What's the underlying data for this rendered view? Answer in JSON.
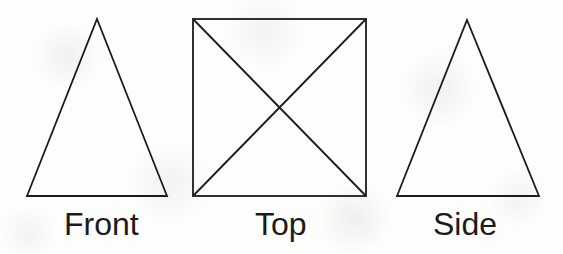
{
  "figure": {
    "width": 563,
    "height": 254,
    "background_color": "#fdfdfc",
    "line_color": "#1b1b1b",
    "line_width": 1.8,
    "label_color": "#1b1b1b",
    "label_font_size": 32
  },
  "views": [
    {
      "id": "front",
      "label": "Front",
      "shape": "triangle",
      "points": "97,19 167,196 27,196",
      "label_left": 64,
      "label_top": 208
    },
    {
      "id": "top",
      "label": "Top",
      "shape": "square-with-diagonals",
      "rect": {
        "x": 193,
        "y": 19,
        "width": 173,
        "height": 177
      },
      "diagonal_1": {
        "x1": 193,
        "y1": 19,
        "x2": 366,
        "y2": 196
      },
      "diagonal_2": {
        "x1": 366,
        "y1": 19,
        "x2": 193,
        "y2": 196
      },
      "label_left": 255,
      "label_top": 208
    },
    {
      "id": "side",
      "label": "Side",
      "shape": "triangle",
      "points": "467,20 539,196 397,196",
      "label_left": 433,
      "label_top": 208
    }
  ]
}
